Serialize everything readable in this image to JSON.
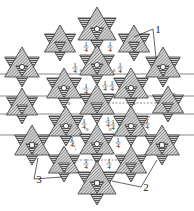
{
  "figure": {
    "callouts": [
      {
        "id": "label-1",
        "text": "1",
        "x": 155,
        "y": 33,
        "targets": [
          [
            134,
            37
          ],
          [
            156,
            58
          ]
        ]
      },
      {
        "id": "label-2",
        "text": "2",
        "x": 143,
        "y": 191,
        "targets": [
          [
            112,
            181
          ],
          [
            157,
            160
          ]
        ]
      },
      {
        "id": "label-3",
        "text": "3",
        "x": 36,
        "y": 183,
        "targets": [
          [
            62,
            177
          ],
          [
            38,
            158
          ]
        ]
      }
    ],
    "void_labels": [
      {
        "text": "1/4",
        "x": 86,
        "y": 47
      },
      {
        "text": "1/4",
        "x": 110,
        "y": 47
      },
      {
        "text": "1/4",
        "x": 75,
        "y": 68
      },
      {
        "text": "0",
        "x": 81,
        "y": 72
      },
      {
        "text": "1/4",
        "x": 120,
        "y": 68
      },
      {
        "text": "0",
        "x": 114,
        "y": 72
      },
      {
        "text": "1/4",
        "x": 86,
        "y": 89
      },
      {
        "text": "1/4",
        "x": 105,
        "y": 86
      },
      {
        "text": "1/4",
        "x": 112,
        "y": 86
      },
      {
        "text": "0",
        "x": 69,
        "y": 105
      },
      {
        "text": "0",
        "x": 134,
        "y": 105
      },
      {
        "text": "0",
        "x": 174,
        "y": 96
      },
      {
        "text": "1/4",
        "x": 84,
        "y": 124
      },
      {
        "text": "0",
        "x": 87,
        "y": 131
      },
      {
        "text": "1/4",
        "x": 108,
        "y": 122
      },
      {
        "text": "1/4",
        "x": 113,
        "y": 125
      },
      {
        "text": "0",
        "x": 110,
        "y": 131
      },
      {
        "text": "1/4",
        "x": 147,
        "y": 124
      },
      {
        "text": "1/4",
        "x": 72,
        "y": 142
      },
      {
        "text": "1/4",
        "x": 118,
        "y": 143
      },
      {
        "text": "1/4",
        "x": 86,
        "y": 164
      },
      {
        "text": "1/4",
        "x": 109,
        "y": 164
      }
    ],
    "stars": [
      {
        "x": 97,
        "y": 29,
        "r": 22,
        "center": "circle"
      },
      {
        "x": 60,
        "y": 43,
        "r": 18,
        "center": "none"
      },
      {
        "x": 134,
        "y": 43,
        "r": 18,
        "center": "none"
      },
      {
        "x": 22,
        "y": 67,
        "r": 20,
        "center": "circle"
      },
      {
        "x": 97,
        "y": 65,
        "r": 20,
        "center": "circle"
      },
      {
        "x": 163,
        "y": 67,
        "r": 20,
        "center": "circle"
      },
      {
        "x": 64,
        "y": 88,
        "r": 20,
        "center": "circle"
      },
      {
        "x": 131,
        "y": 88,
        "r": 20,
        "center": "circle"
      },
      {
        "x": 22,
        "y": 106,
        "r": 18,
        "center": "none"
      },
      {
        "x": 97,
        "y": 104,
        "r": 20,
        "center": "none"
      },
      {
        "x": 168,
        "y": 104,
        "r": 18,
        "center": "none"
      },
      {
        "x": 66,
        "y": 126,
        "r": 20,
        "center": "circle"
      },
      {
        "x": 131,
        "y": 126,
        "r": 20,
        "center": "circle"
      },
      {
        "x": 32,
        "y": 145,
        "r": 20,
        "center": "square"
      },
      {
        "x": 97,
        "y": 144,
        "r": 20,
        "center": "circle"
      },
      {
        "x": 162,
        "y": 145,
        "r": 20,
        "center": "square"
      },
      {
        "x": 64,
        "y": 164,
        "r": 18,
        "center": "none"
      },
      {
        "x": 131,
        "y": 164,
        "r": 18,
        "center": "none"
      },
      {
        "x": 97,
        "y": 183,
        "r": 22,
        "center": "square"
      }
    ]
  }
}
